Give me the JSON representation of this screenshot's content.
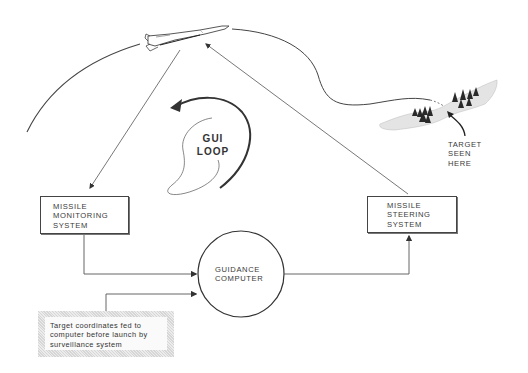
{
  "diagram": {
    "title_loop": {
      "line1": "GUI",
      "line2": "LOOP"
    },
    "nodes": {
      "monitoring": {
        "line1": "MISSILE",
        "line2": "MONITORING",
        "line3": "SYSTEM"
      },
      "steering": {
        "line1": "MISSILE",
        "line2": "STEERING",
        "line3": "SYSTEM"
      },
      "computer": {
        "line1": "GUIDANCE",
        "line2": "COMPUTER"
      },
      "target_input": {
        "line1": "Target coordinates fed to",
        "line2": "computer before launch by",
        "line3": "surveillance system"
      }
    },
    "target_annotation": {
      "line1": "TARGET",
      "line2": "SEEN",
      "line3": "HERE"
    },
    "edges": [
      {
        "from": "missile",
        "to": "monitoring"
      },
      {
        "from": "monitoring",
        "to": "computer"
      },
      {
        "from": "target_input",
        "to": "computer"
      },
      {
        "from": "computer",
        "to": "steering"
      },
      {
        "from": "steering",
        "to": "missile"
      }
    ],
    "colors": {
      "line": "#444444",
      "text": "#3a3a3a",
      "note_hatch": "#d6d6d6"
    }
  }
}
